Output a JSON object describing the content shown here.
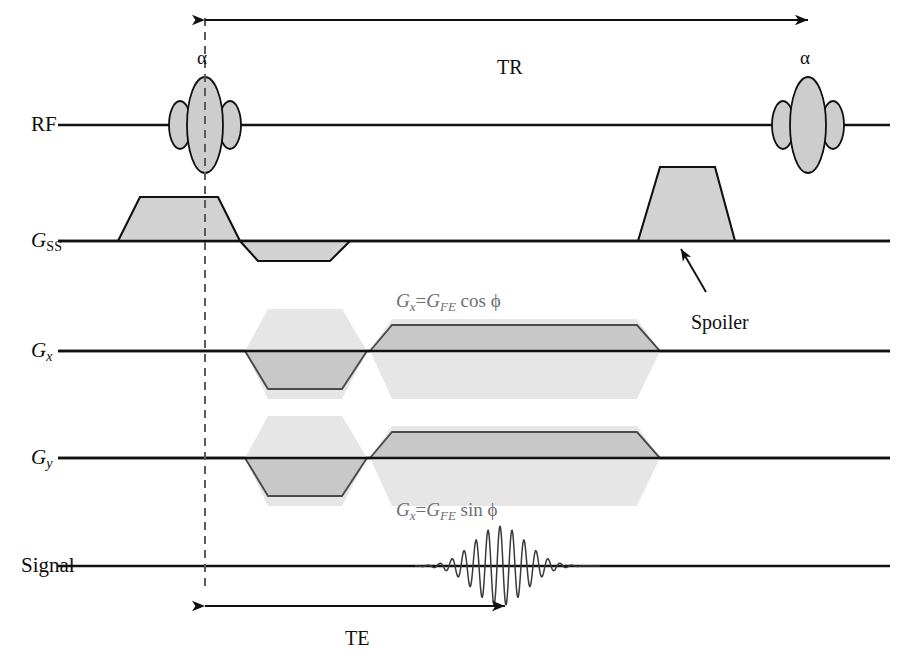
{
  "figure": {
    "kind": "mri-pulse-sequence-diagram",
    "background_color": "#ffffff",
    "line_color": "#111111",
    "fill_gray": "#cfcfcf",
    "ghost_gray": "#e4e4e4",
    "formula_color": "#6e6e74"
  },
  "rows": [
    {
      "id": "rf",
      "label_html": "RF",
      "label_x": 31,
      "label_y": 114,
      "baseline_y": 125
    },
    {
      "id": "gss",
      "label_html": "G_SS",
      "label_x": 31,
      "label_y": 230,
      "baseline_y": 241
    },
    {
      "id": "gx",
      "label_html": "G_x",
      "label_x": 31,
      "label_y": 340,
      "baseline_y": 351
    },
    {
      "id": "gy",
      "label_html": "G_y",
      "label_x": 31,
      "label_y": 447,
      "baseline_y": 458
    },
    {
      "id": "signal",
      "label_html": "Signal",
      "label_x": 21,
      "label_y": 555,
      "baseline_y": 566
    }
  ],
  "row_labels": {
    "rf": "RF",
    "gss_main": "G",
    "gss_sub": "SS",
    "gx_main": "G",
    "gx_sub": "x",
    "gy_main": "G",
    "gy_sub": "y",
    "signal": "Signal"
  },
  "axis": {
    "x_start": 58,
    "x_end": 890,
    "line_width": 2.6
  },
  "timing_marker": {
    "dashed_line_x": 205,
    "dashed_top_y": 18,
    "dashed_bottom_y": 592,
    "dash_color": "#5a5a5a"
  },
  "intervals": [
    {
      "id": "tr",
      "label": "TR",
      "label_x": 497,
      "label_y": 57,
      "arrow_y": 20,
      "x_from": 205,
      "x_to": 808,
      "double_headed": true
    },
    {
      "id": "te",
      "label": "TE",
      "label_x": 345,
      "label_y": 628,
      "arrow_y": 606,
      "x_from": 205,
      "x_to": 505,
      "double_headed": true
    }
  ],
  "rf_pulses": [
    {
      "id": "rf-pulse-excitation-1",
      "label": "α",
      "label_x": 197,
      "label_y": 48,
      "center_x": 205,
      "center_y": 125,
      "main_rx": 18,
      "main_ry": 48,
      "side_rx": 11,
      "side_ry": 24,
      "side_offset": 25
    },
    {
      "id": "rf-pulse-excitation-2",
      "label": "α",
      "label_x": 800,
      "label_y": 48,
      "center_x": 808,
      "center_y": 125,
      "main_rx": 18,
      "main_ry": 48,
      "side_rx": 11,
      "side_ry": 24,
      "side_offset": 25
    }
  ],
  "gradients": {
    "gss": {
      "baseline_y": 241,
      "slice_select": {
        "name": "slice-select-lobe",
        "x_rise_start": 118,
        "x_flat_start": 140,
        "x_flat_end": 218,
        "x_fall_end": 240,
        "height": -44
      },
      "rephase": {
        "name": "slice-rephase-lobe",
        "x_rise_start": 240,
        "x_flat_start": 258,
        "x_flat_end": 330,
        "x_fall_end": 350,
        "height": 20
      },
      "spoiler": {
        "name": "spoiler-lobe",
        "x_rise_start": 638,
        "x_flat_start": 660,
        "x_flat_end": 715,
        "x_fall_end": 735,
        "height": -74
      }
    },
    "gx": {
      "baseline_y": 351,
      "dephase": {
        "name": "gx-dephase-lobe",
        "x_rise_start": 245,
        "x_flat_start": 268,
        "x_flat_end": 342,
        "x_fall_end": 367,
        "height": 38
      },
      "dephase_ghost": {
        "x_left": 245,
        "x_right": 367,
        "x_flat_left": 268,
        "x_flat_right": 342,
        "height_up": 42,
        "height_down": 48
      },
      "readout": {
        "name": "gx-readout-lobe",
        "x_rise_start": 370,
        "x_flat_start": 392,
        "x_flat_end": 637,
        "x_fall_end": 660,
        "height": -26
      },
      "readout_ghost": {
        "x_left": 370,
        "x_right": 660,
        "x_flat_left": 392,
        "x_flat_right": 637,
        "height_up": 32,
        "height_down": 48
      }
    },
    "gy": {
      "baseline_y": 458,
      "dephase": {
        "name": "gy-dephase-lobe",
        "x_rise_start": 245,
        "x_flat_start": 268,
        "x_flat_end": 342,
        "x_fall_end": 367,
        "height": 38
      },
      "dephase_ghost": {
        "x_left": 245,
        "x_right": 367,
        "x_flat_left": 268,
        "x_flat_right": 342,
        "height_up": 42,
        "height_down": 48
      },
      "readout": {
        "name": "gy-readout-lobe",
        "x_rise_start": 370,
        "x_flat_start": 392,
        "x_flat_end": 637,
        "x_fall_end": 660,
        "height": -26
      },
      "readout_ghost": {
        "x_left": 370,
        "x_right": 660,
        "x_flat_left": 392,
        "x_flat_right": 637,
        "height_up": 32,
        "height_down": 48
      }
    }
  },
  "signal": {
    "baseline_y": 566,
    "echo": {
      "name": "gradient-echo",
      "center_x": 500,
      "x_start": 415,
      "x_end": 600,
      "peak_amplitude": 40,
      "oscillation_period": 12,
      "envelope_sigma": 26
    }
  },
  "annotations": [
    {
      "id": "spoiler-annotation",
      "label": "Spoiler",
      "label_x": 691,
      "label_y": 312,
      "arrow_from_x": 706,
      "arrow_from_y": 290,
      "arrow_to_x": 681,
      "arrow_to_y": 246
    }
  ],
  "formulas": [
    {
      "id": "gx-formula",
      "row": "gx",
      "x": 396,
      "y": 291,
      "main": "G",
      "sub": "x",
      "equals": "=",
      "main2": "G",
      "sub2": "FE",
      "trig": "cos",
      "angle": "ϕ",
      "plain": "Gx=GFE cos ϕ"
    },
    {
      "id": "gy-formula",
      "row": "gy",
      "x": 396,
      "y": 500,
      "main": "G",
      "sub": "x",
      "equals": "=",
      "main2": "G",
      "sub2": "FE",
      "trig": "sin",
      "angle": "ϕ",
      "plain": "Gx=GFE sin ϕ"
    }
  ]
}
